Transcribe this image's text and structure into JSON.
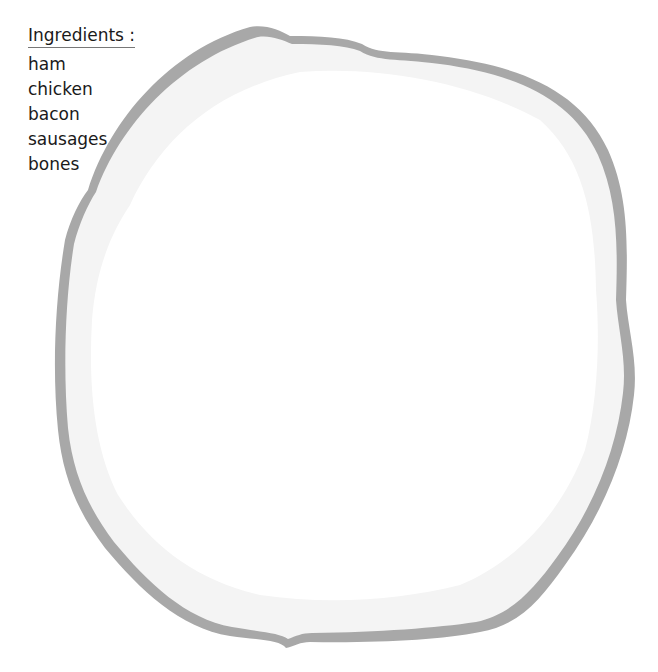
{
  "ingredients": {
    "title": "Ingredients :",
    "items": [
      "ham",
      "chicken",
      "bacon",
      "sausages",
      "bones"
    ]
  },
  "illustration": {
    "name": "pot-outline",
    "outline_color": "#a8a8a8",
    "inner_fill_color": "#f4f4f4",
    "center_fill_color": "#ffffff"
  }
}
